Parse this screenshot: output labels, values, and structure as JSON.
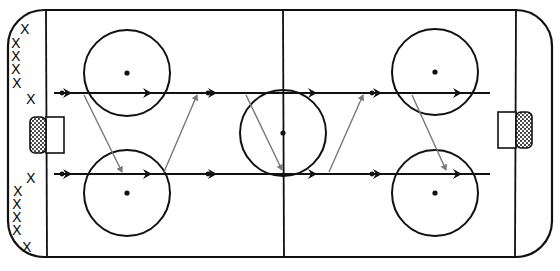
{
  "diagram": {
    "colors": {
      "rink_lines": "#111111",
      "skate_path": "#111111",
      "pass_line": "#777777",
      "net_fill": "#555555",
      "background": "#ffffff"
    },
    "rink": {
      "x": 8,
      "y": 10,
      "width": 544,
      "height": 247,
      "corner_radius": 36
    },
    "lines": {
      "left_goal_line_x": 46,
      "right_goal_line_x": 516,
      "center_line_x": 283
    },
    "nets": [
      {
        "side": "left",
        "x": 30,
        "y": 117,
        "w": 16,
        "h": 36,
        "crease_w": 18
      },
      {
        "side": "right",
        "x": 516,
        "y": 112,
        "w": 16,
        "h": 36,
        "crease_w": 18
      }
    ],
    "faceoff_circles": [
      {
        "id": "top-left",
        "cx": 127,
        "cy": 73,
        "r": 43
      },
      {
        "id": "bottom-left",
        "cx": 127,
        "cy": 193,
        "r": 43
      },
      {
        "id": "center",
        "cx": 283,
        "cy": 133,
        "r": 43
      },
      {
        "id": "top-right",
        "cx": 435,
        "cy": 72,
        "r": 43
      },
      {
        "id": "bottom-right",
        "cx": 435,
        "cy": 193,
        "r": 43
      }
    ],
    "players": {
      "marker": "X",
      "top_group": [
        {
          "x": 25,
          "y": 29
        },
        {
          "x": 16,
          "y": 43
        },
        {
          "x": 16,
          "y": 56
        },
        {
          "x": 16,
          "y": 69
        },
        {
          "x": 17,
          "y": 83
        },
        {
          "x": 31,
          "y": 99
        }
      ],
      "bottom_group": [
        {
          "x": 31,
          "y": 178
        },
        {
          "x": 18,
          "y": 191
        },
        {
          "x": 17,
          "y": 204
        },
        {
          "x": 17,
          "y": 217
        },
        {
          "x": 17,
          "y": 230
        },
        {
          "x": 27,
          "y": 247
        }
      ]
    },
    "skate_lanes": [
      {
        "id": "top-lane",
        "y": 93,
        "x_start": 54,
        "x_end": 490
      },
      {
        "id": "bottom-lane",
        "y": 174,
        "x_start": 54,
        "x_end": 490
      }
    ],
    "passes": [
      {
        "from": [
          84,
          95
        ],
        "to": [
          122,
          172
        ]
      },
      {
        "from": [
          164,
          172
        ],
        "to": [
          197,
          95
        ]
      },
      {
        "from": [
          246,
          95
        ],
        "to": [
          282,
          170
        ]
      },
      {
        "from": [
          329,
          172
        ],
        "to": [
          363,
          95
        ]
      },
      {
        "from": [
          412,
          95
        ],
        "to": [
          446,
          170
        ]
      }
    ]
  }
}
